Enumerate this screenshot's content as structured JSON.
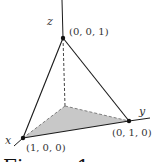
{
  "figure": {
    "axes": {
      "x_label": "x",
      "y_label": "y",
      "z_label": "z"
    },
    "vertices": [
      {
        "name": "z-vertex",
        "label": "(0, 0, 1)"
      },
      {
        "name": "x-vertex",
        "label": "(1, 0, 0)"
      },
      {
        "name": "y-vertex",
        "label": "(0, 1, 0)"
      }
    ],
    "caption": "Figure 1",
    "colors": {
      "line": "#1a1a1a",
      "shade": "#c8c8c8",
      "text": "#333333"
    }
  }
}
